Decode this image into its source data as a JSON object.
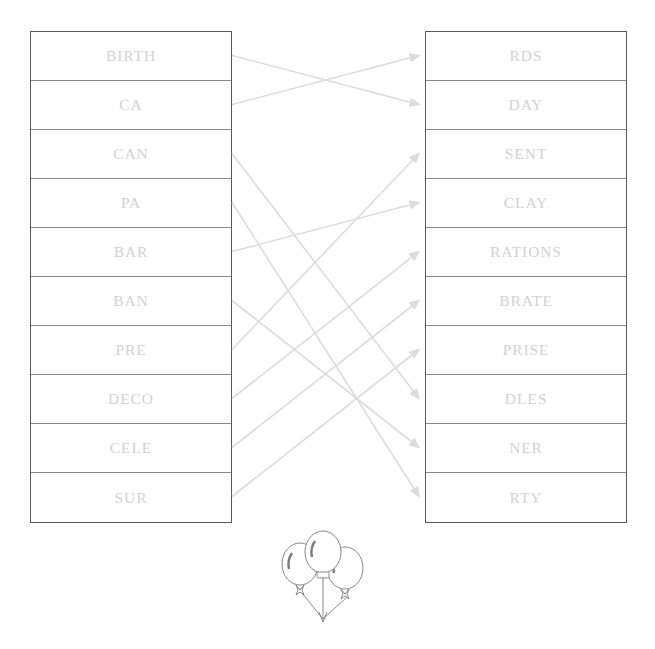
{
  "diagram": {
    "type": "word-matching-puzzle",
    "title_visible": false,
    "left_column": {
      "name": "word-prefixes",
      "items": [
        {
          "label": "BIRTH"
        },
        {
          "label": "CA"
        },
        {
          "label": "CAN"
        },
        {
          "label": "PA"
        },
        {
          "label": "BAR"
        },
        {
          "label": "BAN"
        },
        {
          "label": "PRE"
        },
        {
          "label": "DECO"
        },
        {
          "label": "CELE"
        },
        {
          "label": "SUR"
        }
      ]
    },
    "right_column": {
      "name": "word-suffixes",
      "items": [
        {
          "label": "RDS"
        },
        {
          "label": "DAY"
        },
        {
          "label": "SENT"
        },
        {
          "label": "CLAY"
        },
        {
          "label": "RATIONS"
        },
        {
          "label": "BRATE"
        },
        {
          "label": "PRISE"
        },
        {
          "label": "DLES"
        },
        {
          "label": "NER"
        },
        {
          "label": "RTY"
        }
      ]
    },
    "connections": [
      {
        "from": "BIRTH",
        "to": "DAY",
        "from_index": 0,
        "to_index": 1
      },
      {
        "from": "CA",
        "to": "RDS",
        "from_index": 1,
        "to_index": 0
      },
      {
        "from": "CAN",
        "to": "DLES",
        "from_index": 2,
        "to_index": 7
      },
      {
        "from": "PA",
        "to": "RTY",
        "from_index": 3,
        "to_index": 9
      },
      {
        "from": "BAR",
        "to": "CLAY",
        "from_index": 4,
        "to_index": 3
      },
      {
        "from": "BAN",
        "to": "NER",
        "from_index": 5,
        "to_index": 8
      },
      {
        "from": "PRE",
        "to": "SENT",
        "from_index": 6,
        "to_index": 2
      },
      {
        "from": "DECO",
        "to": "RATIONS",
        "from_index": 7,
        "to_index": 4
      },
      {
        "from": "CELE",
        "to": "BRATE",
        "from_index": 8,
        "to_index": 5
      },
      {
        "from": "SUR",
        "to": "PRISE",
        "from_index": 9,
        "to_index": 6
      }
    ],
    "decoration": {
      "name": "balloons-illustration",
      "description": "line-art bunch of three balloons"
    },
    "colors": {
      "text": "#d2d2d2",
      "cell_border": "#8a8a8a",
      "outer_border": "#595959",
      "connector": "#dcdcdc",
      "background": "#ffffff",
      "illustration_stroke": "#7a7a7a"
    }
  }
}
